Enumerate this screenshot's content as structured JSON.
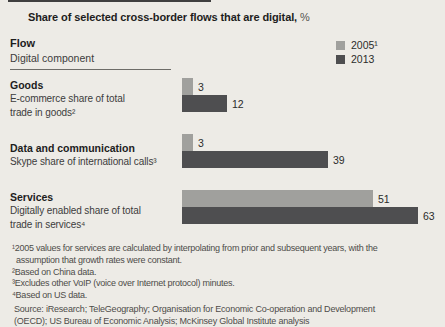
{
  "title": {
    "text": "Share of selected cross-border flows that are digital,",
    "unit": " %"
  },
  "header": {
    "flow": "Flow",
    "component": "Digital component"
  },
  "legend": {
    "items": [
      {
        "label": "2005¹",
        "color": "#a0a09d"
      },
      {
        "label": "2013",
        "color": "#4e4e50"
      }
    ]
  },
  "chart_data": {
    "type": "bar",
    "orientation": "horizontal",
    "title": "Share of selected cross-border flows that are digital, %",
    "unit": "%",
    "categories": [
      "Goods",
      "Data and communication",
      "Services"
    ],
    "category_sublabels": [
      "E-commerce share of total trade in goods²",
      "Skype share of international calls³",
      "Digitally enabled share of total trade in services⁴"
    ],
    "series": [
      {
        "name": "2005¹",
        "color": "#a0a09d",
        "values": [
          3,
          3,
          51
        ]
      },
      {
        "name": "2013",
        "color": "#4e4e50",
        "values": [
          12,
          39,
          63
        ]
      }
    ],
    "xlim": [
      0,
      66
    ],
    "grid": false,
    "legend_position": "top-right",
    "data_labels": true,
    "px_per_unit": 3.75
  },
  "sections": [
    {
      "name": "Goods",
      "desc1": "E-commerce share of total",
      "desc2": "trade in goods²"
    },
    {
      "name": "Data and communication",
      "desc1": "Skype share of international calls³",
      "desc2": ""
    },
    {
      "name": "Services",
      "desc1": "Digitally enabled share of total",
      "desc2": "trade in services⁴"
    }
  ],
  "footnotes": {
    "line1": "¹2005 values for services are calculated by interpolating from prior and subsequent years, with the",
    "line2": "assumption that growth rates were constant.",
    "line3": "²Based on China data.",
    "line4": "³Excludes other VoIP (voice over Internet protocol) minutes.",
    "line5": "⁴Based on US data."
  },
  "source": {
    "line1": "Source: iResearch; TeleGeography; Organisation for Economic Co-operation and Development",
    "line2": "(OECD); US Bureau of Economic Analysis; McKinsey Global Institute analysis"
  }
}
